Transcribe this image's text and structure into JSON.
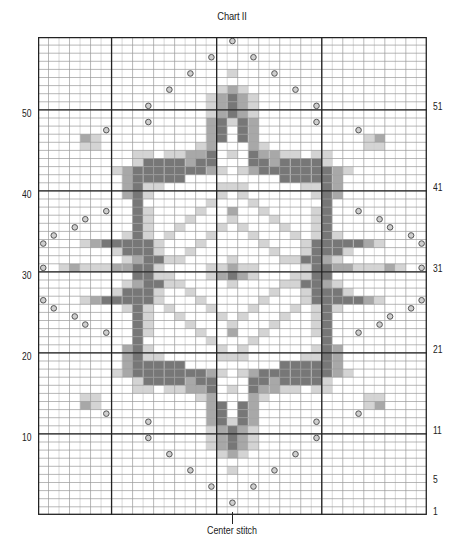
{
  "title": "Chart II",
  "center_label": "Center stitch",
  "grid": {
    "columns": 37,
    "rows": 59,
    "origin_x": 38,
    "origin_y": 37,
    "cell_w": 10.51,
    "cell_h": 8.1,
    "thick_cols": [
      7,
      17,
      27
    ],
    "thick_rows_from_bottom": [
      10,
      20,
      30,
      40,
      50
    ]
  },
  "colors": {
    "background": "#ffffff",
    "grid_line": "#9a9a9a",
    "grid_line_light": "#c8c8c8",
    "thick_line": "#222222",
    "light": "#d4d4d4",
    "mid": "#a8a8a8",
    "dark": "#777777",
    "circle": "#555555"
  },
  "legend_key": {
    ".": "empty",
    "l": "light gray",
    "m": "medium gray",
    "d": "dark gray",
    "o": "circle symbol"
  },
  "left_labels": [
    {
      "text": "50",
      "row": 50
    },
    {
      "text": "40",
      "row": 40
    },
    {
      "text": "30",
      "row": 30
    },
    {
      "text": "20",
      "row": 20
    },
    {
      "text": "10",
      "row": 10
    }
  ],
  "right_labels": [
    {
      "text": "51",
      "row": 51
    },
    {
      "text": "41",
      "row": 41
    },
    {
      "text": "31",
      "row": 31
    },
    {
      "text": "21",
      "row": 21
    },
    {
      "text": "11",
      "row": 11
    },
    {
      "text": "5",
      "row": 5
    },
    {
      "text": "1",
      "row": 1
    }
  ],
  "pattern_half_rows_top_to_bottom": [
    "..................o",
    "...................",
    "................o..",
    "...................",
    "..............o...l",
    "...................",
    "............o....lm",
    "................lmd",
    "..........o.....lmd",
    "................lmd",
    "..........o.....mdl",
    "......o.........md.",
    "....ml..........md.",
    "....ll.........lm..",
    ".........ll.llmmd.l",
    ".........lddddmdd..",
    ".......lmdddddddml.",
    "........mddddd.....",
    "........mdll.....ll",
    "........mdl......l.",
    ".........d......l..",
    "......o..dl....l..m",
    "....o....dl...l...l",
    "...o.....dl..l...l.",
    ".o......ldl.l...l..",
    "o...lmdddddl...l...",
    ".......ldddl..l....",
    "........lmddll....l",
    "o.lmlllmmddl....llm",
    ".........ddll...lmd",
    "........lmddll....l",
    ".......ldddl..l....",
    "o...lmdddddl...l...",
    ".o......ldl.l...l..",
    "...o.....dl..l...l.",
    "....o....dl...l...l",
    "......o..dl....l..m",
    ".........d......l..",
    "........mdl......l.",
    "........mdll.....ll",
    "........mddddd.....",
    ".......lmdddddddml.",
    ".........lddddmdd..",
    ".........ll.llmmd.l",
    "....ll.........lm..",
    "....ml..........md.",
    "......o.........md.",
    "..........o.....mdl",
    "................lmd",
    "..........o.....lmd",
    "................lmd",
    "............o....lm",
    "...................",
    "..............o...l",
    "...................",
    "................o..",
    "...................",
    "..................o",
    "..................."
  ]
}
